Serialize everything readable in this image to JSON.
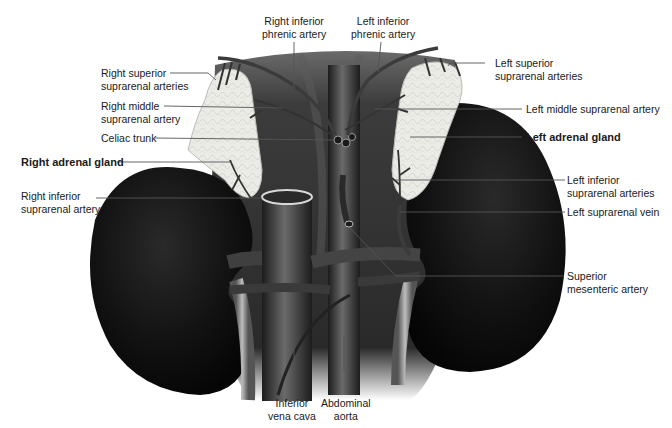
{
  "figure": {
    "colors": {
      "kidney": "#0e0e0e",
      "gland": "#e9e9e4",
      "vessel": "#3a3a3a",
      "leader": "#555555",
      "text": "#1a1a1a"
    },
    "labels": {
      "right_inferior_phrenic_artery": [
        "Right inferior",
        "phrenic artery"
      ],
      "left_inferior_phrenic_artery": [
        "Left inferior",
        "phrenic artery"
      ],
      "right_superior_suprarenal_arteries": [
        "Right superior",
        "suprarenal arteries"
      ],
      "left_superior_suprarenal_arteries": [
        "Left superior",
        "suprarenal arteries"
      ],
      "right_middle_suprarenal_artery": [
        "Right middle",
        "suprarenal artery"
      ],
      "left_middle_suprarenal_artery": [
        "Left middle suprarenal artery"
      ],
      "celiac_trunk": [
        "Celiac trunk"
      ],
      "left_adrenal_gland": [
        "Left adrenal gland"
      ],
      "right_adrenal_gland": [
        "Right adrenal gland"
      ],
      "left_inferior_suprarenal_arteries": [
        "Left inferior",
        "suprarenal arteries"
      ],
      "right_inferior_suprarenal_artery": [
        "Right inferior",
        "suprarenal artery"
      ],
      "left_suprarenal_vein": [
        "Left suprarenal vein"
      ],
      "superior_mesenteric_artery": [
        "Superior",
        "mesenteric artery"
      ],
      "inferior_vena_cava": [
        "Inferior",
        "vena cava"
      ],
      "abdominal_aorta": [
        "Abdominal",
        "aorta"
      ]
    }
  }
}
